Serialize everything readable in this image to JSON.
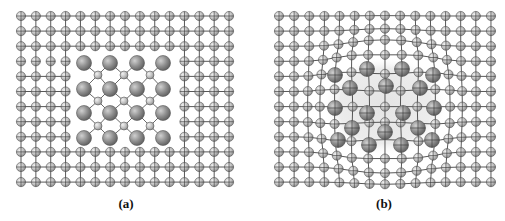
{
  "figure": {
    "panels": [
      {
        "id": "a",
        "label": "(a)",
        "description": "Incoherent precipitate in host lattice",
        "grid": {
          "x0": 21,
          "y0": 16,
          "dx": 14.86,
          "dy": 15.1,
          "cols": 15,
          "rows": 12
        },
        "hole": {
          "col_start": 4,
          "col_end": 10,
          "row_start": 3,
          "row_end": 8
        },
        "unbonded_row": {
          "row": 3,
          "col_start": 0,
          "col_end": 3
        },
        "precipitate_large": [
          [
            84,
            63
          ],
          [
            110,
            63
          ],
          [
            137,
            63
          ],
          [
            163,
            63
          ],
          [
            84,
            89
          ],
          [
            110,
            89
          ],
          [
            137,
            89
          ],
          [
            163,
            89
          ],
          [
            84,
            113
          ],
          [
            110,
            113
          ],
          [
            137,
            113
          ],
          [
            163,
            113
          ],
          [
            84,
            138
          ],
          [
            110,
            138
          ],
          [
            137,
            138
          ],
          [
            163,
            138
          ]
        ],
        "precipitate_small": [
          [
            98,
            75
          ],
          [
            124,
            75
          ],
          [
            150,
            75
          ],
          [
            98,
            101
          ],
          [
            124,
            101
          ],
          [
            150,
            101
          ],
          [
            98,
            126
          ],
          [
            124,
            126
          ],
          [
            150,
            126
          ]
        ]
      },
      {
        "id": "b",
        "label": "(b)",
        "description": "Coherent precipitate straining host lattice",
        "grid": {
          "x0": 279,
          "y0": 16,
          "dx": 15.14,
          "dy": 15.1,
          "cols": 15,
          "rows": 12
        },
        "halo": {
          "cx": 385,
          "cy": 106,
          "rx": 62,
          "ry": 50
        },
        "distortion": {
          "cx": 385,
          "cy": 106,
          "strength": 9,
          "radius": 52
        },
        "precipitate_large": [
          [
            335,
            75
          ],
          [
            367,
            69
          ],
          [
            402,
            69
          ],
          [
            433,
            75
          ],
          [
            350,
            88
          ],
          [
            386,
            86
          ],
          [
            420,
            88
          ],
          [
            335,
            108
          ],
          [
            367,
            113
          ],
          [
            403,
            113
          ],
          [
            434,
            108
          ],
          [
            352,
            128
          ],
          [
            385,
            132
          ],
          [
            418,
            128
          ],
          [
            338,
            140
          ],
          [
            369,
            145
          ],
          [
            401,
            145
          ],
          [
            432,
            140
          ]
        ]
      }
    ]
  },
  "colors": {
    "atom_fill": "#b8b8b8",
    "atom_stroke": "#555555",
    "large_atom_fill": "#8a8a8a",
    "bond": "#444444",
    "halo": "#e6e6e6"
  },
  "radii": {
    "host": 4.6,
    "small": 4.0,
    "large": 7.5
  }
}
